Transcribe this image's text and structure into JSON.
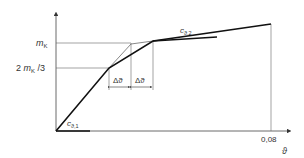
{
  "diagram": {
    "y_axis": {
      "ticks": [
        {
          "label_main": "m",
          "label_sub": "K",
          "level": "mK"
        },
        {
          "label_prefix": "2 ",
          "label_main": "m",
          "label_sub": "K",
          "label_suffix": " /3",
          "level": "2mK/3"
        }
      ]
    },
    "x_axis": {
      "tick_label": "0,08",
      "axis_label": "ϑ"
    },
    "annotations": {
      "c1_main": "c",
      "c1_sub": "ϑ,1",
      "c2_main": "c",
      "c2_sub": "ϑ,2",
      "delta1": "Δϑ",
      "delta2": "Δϑ"
    },
    "colors": {
      "line": "#111111",
      "thin": "#555555",
      "text": "#333333"
    }
  }
}
